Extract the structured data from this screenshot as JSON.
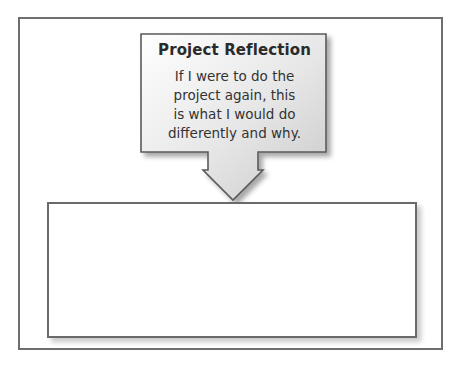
{
  "callout": {
    "title": "Project Reflection",
    "lines": [
      "If I were to do the",
      "project again, this",
      "is what I would do",
      "differently and why."
    ]
  },
  "response_box": {
    "value": ""
  }
}
